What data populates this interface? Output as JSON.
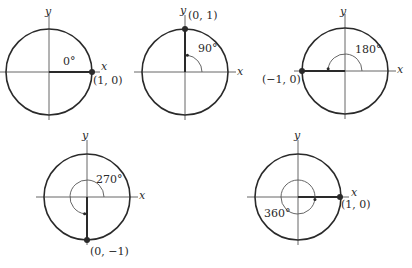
{
  "style": {
    "stroke": "#2a2a2a",
    "axis": "#555555",
    "background": "#ffffff"
  },
  "diagrams": [
    {
      "id": "angle-0",
      "angle_label": "0°",
      "angle_deg": 0,
      "point_label": "(1, 0)",
      "x_axis_label": "x",
      "y_axis_label": "y",
      "center": [
        49,
        72
      ],
      "radius": 43,
      "point": [
        92,
        72
      ],
      "labels": {
        "y": [
          45,
          6
        ],
        "x": [
          101,
          61
        ],
        "point": [
          93,
          75
        ],
        "angle": [
          63,
          56
        ]
      }
    },
    {
      "id": "angle-90",
      "angle_label": "90°",
      "angle_deg": 90,
      "point_label": "(0, 1)",
      "x_axis_label": "x",
      "y_axis_label": "y",
      "center": [
        185,
        72
      ],
      "radius": 43,
      "point": [
        185,
        29
      ],
      "labels": {
        "y": [
          180,
          5
        ],
        "x": [
          237,
          66
        ],
        "point": [
          188,
          10
        ],
        "angle": [
          198,
          43
        ]
      }
    },
    {
      "id": "angle-180",
      "angle_label": "180°",
      "angle_deg": 180,
      "point_label": "(−1, 0)",
      "x_axis_label": "x",
      "y_axis_label": "y",
      "center": [
        345,
        71
      ],
      "radius": 43,
      "point": [
        302,
        71
      ],
      "labels": {
        "y": [
          340,
          6
        ],
        "x": [
          397,
          64
        ],
        "point": [
          262,
          74
        ],
        "angle": [
          355,
          44
        ]
      }
    },
    {
      "id": "angle-270",
      "angle_label": "270°",
      "angle_deg": 270,
      "point_label": "(0, −1)",
      "x_axis_label": "x",
      "y_axis_label": "y",
      "center": [
        87,
        197
      ],
      "radius": 43,
      "point": [
        87,
        240
      ],
      "labels": {
        "y": [
          82,
          130
        ],
        "x": [
          139,
          190
        ],
        "point": [
          90,
          246
        ],
        "angle": [
          96,
          174
        ]
      }
    },
    {
      "id": "angle-360",
      "angle_label": "360°",
      "angle_deg": 360,
      "point_label": "(1, 0)",
      "x_axis_label": "x",
      "y_axis_label": "y",
      "center": [
        298,
        197
      ],
      "radius": 43,
      "point": [
        340,
        197
      ],
      "labels": {
        "y": [
          294,
          130
        ],
        "x": [
          351,
          187
        ],
        "point": [
          341,
          199
        ],
        "angle": [
          264,
          208
        ]
      }
    }
  ]
}
